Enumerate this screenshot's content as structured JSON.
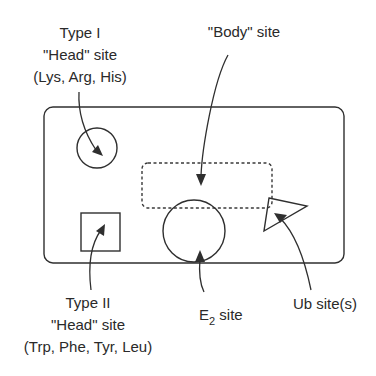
{
  "diagram": {
    "type_i": {
      "line1": "Type I",
      "line2": "\"Head\" site",
      "line3": "(Lys, Arg, His)"
    },
    "body": {
      "label": "\"Body\" site"
    },
    "type_ii": {
      "line1": "Type II",
      "line2": "\"Head\" site",
      "line3": "(Trp, Phe, Tyr, Leu)"
    },
    "e2": {
      "main": "E",
      "sub": "2",
      "rest": " site"
    },
    "ub": {
      "label": "Ub site(s)"
    }
  }
}
